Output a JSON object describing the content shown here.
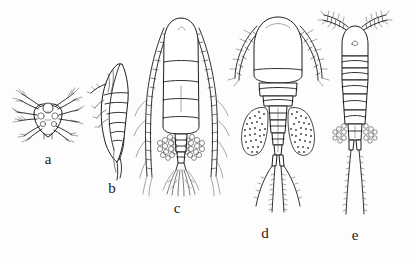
{
  "plate": {
    "title": "Copepod developmental stages",
    "background_color": "#fdfdfd",
    "ink_color": "#1c1c1c",
    "width": 409,
    "height": 257
  },
  "figures": [
    {
      "id": "a",
      "label": "a",
      "label_x": 48,
      "label_y": 152,
      "common_name": "nauplius larva",
      "view": "ventral",
      "description": "Small rounded nauplius body with three pairs of radiating, plumose appendages and scattered setae",
      "features": [
        "rounded-body",
        "radiating-setae",
        "paired-appendages"
      ]
    },
    {
      "id": "b",
      "label": "b",
      "label_x": 112,
      "label_y": 181,
      "common_name": "copepodite",
      "view": "lateral",
      "description": "Elongated leaf-shaped lateral view with segmented urosome and tapering caudal end",
      "features": [
        "lateral-outline",
        "segmented-urosome",
        "tapering-tail"
      ]
    },
    {
      "id": "c",
      "label": "c",
      "label_x": 177,
      "label_y": 201,
      "common_name": "adult female",
      "view": "dorsal",
      "description": "Ovate prosome with four body segments, very long finely segmented antennules sweeping alongside the body, paired granular egg sacs and a dense fan of caudal setae",
      "features": [
        "long-antennules",
        "segmented-prosome",
        "paired-egg-sacs",
        "caudal-seta-fan"
      ]
    },
    {
      "id": "d",
      "label": "d",
      "label_x": 265,
      "label_y": 226,
      "common_name": "adult female",
      "view": "dorsal",
      "description": "Broad oval prosome with short spiny antennules, narrow segmented urosome flanked by two large stippled egg sacs and four long plumose caudal setae",
      "features": [
        "broad-prosome",
        "short-spiny-antennules",
        "large-egg-sacs",
        "four-caudal-setae"
      ]
    },
    {
      "id": "e",
      "label": "e",
      "label_x": 355,
      "label_y": 228,
      "common_name": "adult female",
      "view": "dorsal",
      "description": "Narrow elongate body of stacked ring-like segments, short thick antennules splayed upward, small paired egg sacs and two very long plumose caudal setae",
      "features": [
        "narrow-body",
        "ring-segments",
        "upswept-antennules",
        "two-long-setae"
      ]
    }
  ]
}
